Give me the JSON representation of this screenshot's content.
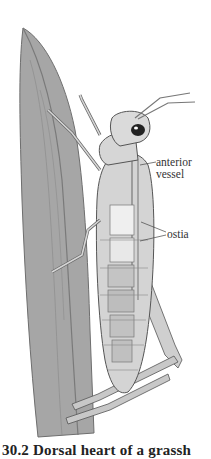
{
  "figure": {
    "labels": {
      "anterior_vessel_line1": "anterior",
      "anterior_vessel_line2": "vessel",
      "ostia": "ostia"
    },
    "caption": "30.2 Dorsal heart of a grassh",
    "colors": {
      "leaf": "#a6a6a6",
      "leaf_dark": "#7d7d7d",
      "body": "#d2d2d2",
      "outline": "#555555",
      "background": "#ffffff"
    }
  }
}
